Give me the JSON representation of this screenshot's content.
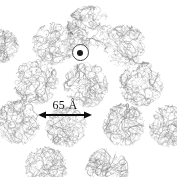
{
  "figure": {
    "title": "",
    "background_color": "#ffffff",
    "width": 177,
    "height": 177,
    "ink_color": "#707070",
    "annotation_color": "#0e0e0e"
  },
  "scale_bar": {
    "label": "65 Å",
    "value": 65,
    "unit": "Å",
    "arrow_style": "double-headed",
    "x": 38,
    "y": 115,
    "length_px": 54
  },
  "center_marker": {
    "name": "axis-marker",
    "shape": "circle-with-dot",
    "x": 80,
    "y": 52,
    "diameter": 17,
    "dot_diameter": 6,
    "outline_color": "#4a4a4a",
    "dot_color": "#1a1a1a"
  },
  "particles": [
    {
      "id": "particle-top",
      "cx": 89,
      "cy": 28,
      "r": 24,
      "seed": 11,
      "shade": 0.8
    },
    {
      "id": "particle-upper-left",
      "cx": 54,
      "cy": 44,
      "r": 23,
      "seed": 23,
      "shade": 0.76
    },
    {
      "id": "particle-upper-right",
      "cx": 125,
      "cy": 46,
      "r": 23,
      "seed": 37,
      "shade": 0.74
    },
    {
      "id": "particle-mid-left",
      "cx": 36,
      "cy": 82,
      "r": 24,
      "seed": 41,
      "shade": 0.82
    },
    {
      "id": "particle-center",
      "cx": 86,
      "cy": 85,
      "r": 24,
      "seed": 53,
      "shade": 0.86
    },
    {
      "id": "particle-mid-right",
      "cx": 141,
      "cy": 84,
      "r": 24,
      "seed": 67,
      "shade": 0.8
    },
    {
      "id": "particle-left-edge",
      "cx": 18,
      "cy": 122,
      "r": 24,
      "seed": 71,
      "shade": 0.84
    },
    {
      "id": "particle-lower-left",
      "cx": 66,
      "cy": 127,
      "r": 22,
      "seed": 83,
      "shade": 0.78
    },
    {
      "id": "particle-lower-right",
      "cx": 124,
      "cy": 125,
      "r": 23,
      "seed": 97,
      "shade": 0.8
    },
    {
      "id": "particle-right-edge",
      "cx": 170,
      "cy": 126,
      "r": 23,
      "seed": 103,
      "shade": 0.76
    },
    {
      "id": "particle-bottom-left",
      "cx": 46,
      "cy": 168,
      "r": 23,
      "seed": 109,
      "shade": 0.82
    },
    {
      "id": "particle-bottom-right",
      "cx": 107,
      "cy": 170,
      "r": 23,
      "seed": 127,
      "shade": 0.82
    },
    {
      "id": "particle-top-left-far",
      "cx": 2,
      "cy": 46,
      "r": 18,
      "seed": 131,
      "shade": 0.7
    }
  ]
}
